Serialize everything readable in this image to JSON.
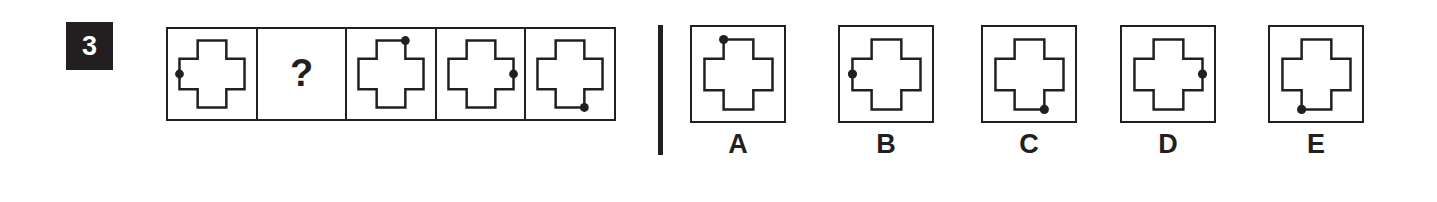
{
  "question": {
    "number": "3",
    "badge_color": "#231f20",
    "ink_color": "#231f20",
    "background_color": "#ffffff"
  },
  "sequence": {
    "name": "cross-with-dot-sequence",
    "cells": [
      {
        "id": "seq-1",
        "content": "cross-figure",
        "dot": "left-middle",
        "dot_label": ""
      },
      {
        "id": "seq-2",
        "content": "question-mark",
        "dot": "none",
        "dot_label": "?"
      },
      {
        "id": "seq-3",
        "content": "cross-figure",
        "dot": "top-right-corner",
        "dot_label": ""
      },
      {
        "id": "seq-4",
        "content": "cross-figure",
        "dot": "right-middle",
        "dot_label": ""
      },
      {
        "id": "seq-5",
        "content": "cross-figure",
        "dot": "bottom-right-corner",
        "dot_label": ""
      }
    ]
  },
  "options": {
    "name": "answer-options",
    "items": [
      {
        "label": "A",
        "dot": "top-left-corner"
      },
      {
        "label": "B",
        "dot": "left-middle"
      },
      {
        "label": "C",
        "dot": "bottom-right-corner"
      },
      {
        "label": "D",
        "dot": "right-middle"
      },
      {
        "label": "E",
        "dot": "bottom-left-corner"
      }
    ]
  }
}
